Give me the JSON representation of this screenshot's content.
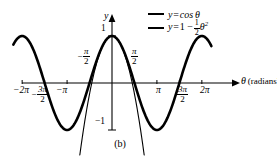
{
  "figure": {
    "caption": "(b)",
    "axis": {
      "x_label_symbol": "θ",
      "x_label_unit": "(radians)",
      "y_label": "y"
    },
    "x_ticks": [
      {
        "id": "m2pi",
        "value": -6.283185,
        "label": "−2π",
        "type": "plain"
      },
      {
        "id": "m3pi2",
        "value": -4.712389,
        "label": "−3π/2",
        "type": "fraction",
        "sign": "−",
        "num": "3π",
        "den": "2"
      },
      {
        "id": "mpi",
        "value": -3.141593,
        "label": "−π",
        "type": "plain"
      },
      {
        "id": "mpi2",
        "value": -1.570796,
        "label": "−π/2",
        "type": "fraction",
        "sign": "−",
        "num": "π",
        "den": "2"
      },
      {
        "id": "pi2",
        "value": 1.570796,
        "label": "π/2",
        "type": "fraction",
        "sign": "",
        "num": "π",
        "den": "2"
      },
      {
        "id": "pi",
        "value": 3.141593,
        "label": "π",
        "type": "plain"
      },
      {
        "id": "3pi2",
        "value": 4.712389,
        "label": "3π/2",
        "type": "fraction",
        "sign": "",
        "num": "3π",
        "den": "2"
      },
      {
        "id": "2pi",
        "value": 6.283185,
        "label": "2π",
        "type": "plain"
      }
    ],
    "y_ticks": [
      {
        "id": "one",
        "value": 1,
        "label": "1"
      },
      {
        "id": "mone",
        "value": -1,
        "label": "−1"
      }
    ],
    "legend": [
      {
        "id": "cos",
        "style": "thick",
        "lhs": "y",
        "eq": "=",
        "rhs": "cos θ"
      },
      {
        "id": "parabola",
        "style": "thin",
        "lhs": "y",
        "eq": "=",
        "rhs_lead": "1 −",
        "frac_num": "1",
        "frac_den": "2",
        "rhs_tail": "θ",
        "rhs_exp": "2"
      }
    ]
  },
  "chart_data": {
    "type": "line",
    "title": "",
    "subtitle": "",
    "xlabel": "θ (radians)",
    "ylabel": "y",
    "xlim": [
      -7.2,
      7.4
    ],
    "ylim": [
      -1.45,
      1.3
    ],
    "grid": false,
    "legend_position": "top-right",
    "x_tick_values": [
      -6.283185,
      -4.712389,
      -3.141593,
      -1.570796,
      1.570796,
      3.141593,
      4.712389,
      6.283185
    ],
    "x_tick_labels": [
      "−2π",
      "−3π/2",
      "−π",
      "−π/2",
      "π/2",
      "π",
      "3π/2",
      "2π"
    ],
    "y_tick_values": [
      1,
      -1
    ],
    "y_tick_labels": [
      "1",
      "−1"
    ],
    "series": [
      {
        "name": "y = cos θ",
        "formula": "cos(x)",
        "line_width": "thick",
        "color": "#000000",
        "x_domain": [
          -6.9,
          6.95
        ],
        "samples": 280
      },
      {
        "name": "y = 1 - 1/2 θ^2",
        "formula": "1 - 0.5*x*x",
        "line_width": "thin",
        "color": "#000000",
        "x_domain": [
          -2.25,
          2.25
        ],
        "samples": 160
      }
    ],
    "annotations": [
      {
        "text": "(b)",
        "position": "below-axis-center"
      }
    ]
  }
}
